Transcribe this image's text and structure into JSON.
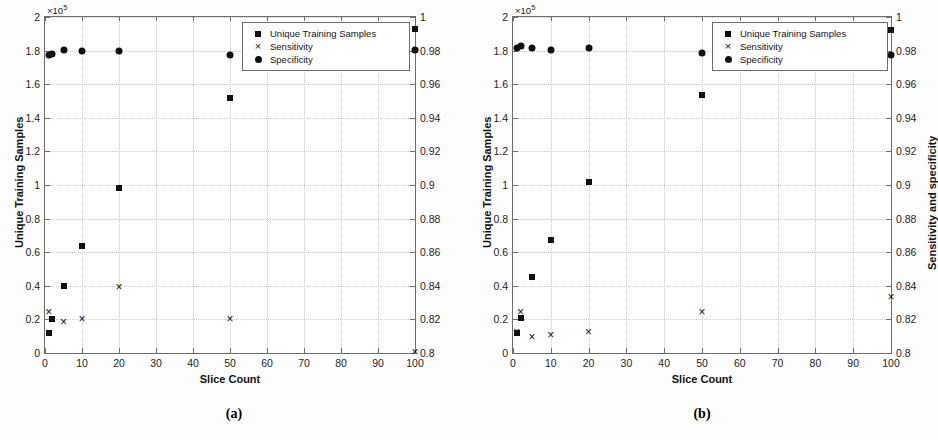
{
  "figure": {
    "panels": [
      {
        "id": "a",
        "caption": "(a)",
        "xlabel": "Slice Count",
        "ylabel_left": "Unique Training Samples",
        "ylabel_right": "",
        "multiplier": "10",
        "multiplier_exp": "5",
        "multiplier_prefix": "×",
        "xticks": [
          "0",
          "10",
          "20",
          "30",
          "40",
          "50",
          "60",
          "70",
          "80",
          "90",
          "100"
        ],
        "yticks_left": [
          "0",
          "0.2",
          "0.4",
          "0.6",
          "0.8",
          "1",
          "1.2",
          "1.4",
          "1.6",
          "1.8",
          "2"
        ],
        "yticks_right": [
          "0.8",
          "0.82",
          "0.84",
          "0.86",
          "0.88",
          "0.9",
          "0.92",
          "0.94",
          "0.96",
          "0.98",
          "1"
        ],
        "legend": [
          {
            "glyph": "square",
            "label": "Unique Training Samples"
          },
          {
            "glyph": "cross",
            "label": "Sensitivity"
          },
          {
            "glyph": "circle",
            "label": "Specificity"
          }
        ]
      },
      {
        "id": "b",
        "caption": "(b)",
        "xlabel": "Slice Count",
        "ylabel_left": "Unique Training Samples",
        "ylabel_right": "Sensitivity and specificity",
        "multiplier": "10",
        "multiplier_exp": "5",
        "multiplier_prefix": "×",
        "xticks": [
          "0",
          "10",
          "20",
          "30",
          "40",
          "50",
          "60",
          "70",
          "80",
          "90",
          "100"
        ],
        "yticks_left": [
          "0",
          "0.2",
          "0.4",
          "0.6",
          "0.8",
          "1",
          "1.2",
          "1.4",
          "1.6",
          "1.8",
          "2"
        ],
        "yticks_right": [
          "0.8",
          "0.82",
          "0.84",
          "0.86",
          "0.88",
          "0.9",
          "0.92",
          "0.94",
          "0.96",
          "0.98",
          "1"
        ],
        "legend": [
          {
            "glyph": "square",
            "label": "Unique Training Samples"
          },
          {
            "glyph": "cross",
            "label": "Sensitivity"
          },
          {
            "glyph": "circle",
            "label": "Specificity"
          }
        ]
      }
    ]
  },
  "chart_data": [
    {
      "type": "scatter",
      "title": "(a)",
      "xlabel": "Slice Count",
      "ylabel": "Unique Training Samples",
      "ylabel_right": "",
      "xlim": [
        0,
        100
      ],
      "ylim": [
        0,
        2
      ],
      "y_multiplier": 100000,
      "ylim_right": [
        0.8,
        1.0
      ],
      "grid": true,
      "legend_position": "top-right",
      "x": [
        1,
        2,
        5,
        10,
        20,
        50,
        100
      ],
      "series": [
        {
          "name": "Unique Training Samples",
          "axis": "left",
          "marker": "square",
          "values": [
            0.12,
            0.205,
            0.4,
            0.635,
            0.985,
            1.515,
            1.93
          ]
        },
        {
          "name": "Sensitivity",
          "axis": "right",
          "marker": "cross",
          "values": [
            0.8245,
            0.8195,
            0.8185,
            0.82,
            0.8395,
            0.82,
            0.8005
          ]
        },
        {
          "name": "Specificity",
          "axis": "right",
          "marker": "circle",
          "values": [
            0.9775,
            0.978,
            0.9805,
            0.9795,
            0.9795,
            0.9775,
            0.9805
          ]
        }
      ]
    },
    {
      "type": "scatter",
      "title": "(b)",
      "xlabel": "Slice Count",
      "ylabel": "Unique Training Samples",
      "ylabel_right": "Sensitivity and specificity",
      "xlim": [
        0,
        100
      ],
      "ylim": [
        0,
        2
      ],
      "y_multiplier": 100000,
      "ylim_right": [
        0.8,
        1.0
      ],
      "grid": true,
      "legend_position": "top-right",
      "x": [
        1,
        2,
        5,
        10,
        20,
        50,
        100
      ],
      "series": [
        {
          "name": "Unique Training Samples",
          "axis": "left",
          "marker": "square",
          "values": [
            0.12,
            0.21,
            0.455,
            0.675,
            1.015,
            1.535,
            1.925
          ]
        },
        {
          "name": "Sensitivity",
          "axis": "right",
          "marker": "cross",
          "values": [
            0.8125,
            0.8245,
            0.8095,
            0.8105,
            0.8125,
            0.8245,
            0.8335
          ]
        },
        {
          "name": "Specificity",
          "axis": "right",
          "marker": "circle",
          "values": [
            0.9815,
            0.9825,
            0.9815,
            0.9805,
            0.9815,
            0.9785,
            0.9775
          ]
        }
      ]
    }
  ]
}
